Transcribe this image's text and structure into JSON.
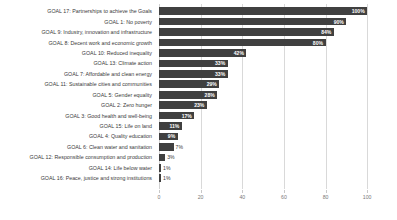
{
  "chart_data": {
    "type": "bar",
    "orientation": "horizontal",
    "title": "",
    "subtitle": "",
    "xlabel": "",
    "ylabel": "",
    "xlim": [
      0,
      110
    ],
    "xticks": [
      "0",
      "20",
      "40",
      "60",
      "80",
      "100"
    ],
    "xtick_values": [
      0,
      20,
      40,
      60,
      80,
      100
    ],
    "grid": true,
    "legend": false,
    "bar_color": "#404040",
    "value_label_color_inside": "#ffffff",
    "value_label_color_outside": "#3a3a3a",
    "categories": [
      "GOAL 17: Partnerships to achieve the Goals",
      "GOAL 1: No poverty",
      "GOAL 9: Industry, innovation and infrastructure",
      "GOAL 8: Decent work and economic growth",
      "GOAL 10: Reduced inequality",
      "GOAL 13: Climate action",
      "GOAL 7: Affordable and clean energy",
      "GOAL 11: Sustainable cities and communities",
      "GOAL 5: Gender equality",
      "GOAL 2: Zero hunger",
      "GOAL 3: Good health and well-being",
      "GOAL 15: Life on land",
      "GOAL 4: Quality education",
      "GOAL 6: Clean water and sanitation",
      "GOAL 12: Responsible consumption and production",
      "GOAL 14: Life below water",
      "GOAL 16: Peace, justice and strong institutions"
    ],
    "values": [
      100,
      90,
      84,
      80,
      42,
      33,
      33,
      29,
      28,
      23,
      17,
      11,
      9,
      7,
      3,
      1,
      1
    ],
    "value_labels": [
      "100%",
      "90%",
      "84%",
      "80%",
      "42%",
      "33%",
      "33%",
      "29%",
      "28%",
      "23%",
      "17%",
      "11%",
      "9%",
      "7%",
      "3%",
      "1%",
      "1%"
    ]
  }
}
